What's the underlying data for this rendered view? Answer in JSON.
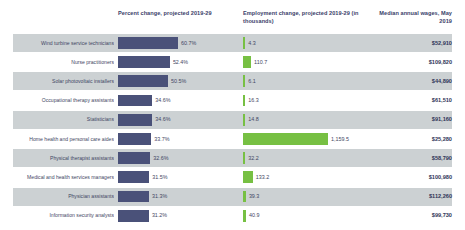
{
  "header": {
    "percent_change": "Percent change, projected 2019-29",
    "employment_change": "Employment change, projected 2019-29 (in thousands)",
    "median_wages": "Median annual wages, May 2019"
  },
  "colors": {
    "percent_bar": "#4a5179",
    "employment_bar": "#77c043",
    "stripe": "#ccd1d3",
    "text": "#3f4663",
    "header_text": "#3a4169"
  },
  "chart_data": {
    "type": "bar",
    "title": "",
    "xlabel": "",
    "ylabel": "",
    "categories": [
      "Wind turbine service technicians",
      "Nurse practitioners",
      "Solar photovoltaic installers",
      "Occupational therapy assistants",
      "Statisticians",
      "Home health and personal care aides",
      "Physical therapist assistants",
      "Medical and health services managers",
      "Physician assistants",
      "Information security analysts"
    ],
    "series": [
      {
        "name": "Percent change, projected 2019-29",
        "unit": "%",
        "values": [
          60.7,
          52.4,
          50.5,
          34.6,
          34.6,
          33.7,
          32.6,
          31.5,
          31.3,
          31.2
        ],
        "labels": [
          "60.7%",
          "52.4%",
          "50.5%",
          "34.6%",
          "34.6%",
          "33.7%",
          "32.6%",
          "31.5%",
          "31.3%",
          "31.2%"
        ]
      },
      {
        "name": "Employment change, projected 2019-29 (in thousands)",
        "unit": "thousands",
        "values": [
          4.3,
          110.7,
          6.1,
          16.3,
          14.8,
          1159.5,
          32.2,
          133.2,
          39.3,
          40.9
        ],
        "labels": [
          "4.3",
          "110.7",
          "6.1",
          "16.3",
          "14.8",
          "1,159.5",
          "32.2",
          "133.2",
          "39.3",
          "40.9"
        ]
      },
      {
        "name": "Median annual wages, May 2019",
        "unit": "USD",
        "values": [
          52910,
          109820,
          44890,
          61510,
          91160,
          25280,
          58790,
          100980,
          112260,
          99730
        ],
        "labels": [
          "$52,910",
          "$109,820",
          "$44,890",
          "$61,510",
          "$91,160",
          "$25,280",
          "$58,790",
          "$100,980",
          "$112,260",
          "$99,730"
        ]
      }
    ]
  },
  "rows": [
    {
      "occupation": "Wind turbine service technicians",
      "percent": 60.7,
      "percent_label": "60.7%",
      "employment": 4.3,
      "employment_label": "4.3",
      "wage_label": "$52,910"
    },
    {
      "occupation": "Nurse practitioners",
      "percent": 52.4,
      "percent_label": "52.4%",
      "employment": 110.7,
      "employment_label": "110.7",
      "wage_label": "$109,820"
    },
    {
      "occupation": "Solar photovoltaic installers",
      "percent": 50.5,
      "percent_label": "50.5%",
      "employment": 6.1,
      "employment_label": "6.1",
      "wage_label": "$44,890"
    },
    {
      "occupation": "Occupational therapy assistants",
      "percent": 34.6,
      "percent_label": "34.6%",
      "employment": 16.3,
      "employment_label": "16.3",
      "wage_label": "$61,510"
    },
    {
      "occupation": "Statisticians",
      "percent": 34.6,
      "percent_label": "34.6%",
      "employment": 14.8,
      "employment_label": "14.8",
      "wage_label": "$91,160"
    },
    {
      "occupation": "Home health and personal care aides",
      "percent": 33.7,
      "percent_label": "33.7%",
      "employment": 1159.5,
      "employment_label": "1,159.5",
      "wage_label": "$25,280"
    },
    {
      "occupation": "Physical therapist assistants",
      "percent": 32.6,
      "percent_label": "32.6%",
      "employment": 32.2,
      "employment_label": "32.2",
      "wage_label": "$58,790"
    },
    {
      "occupation": "Medical and health services managers",
      "percent": 31.5,
      "percent_label": "31.5%",
      "employment": 133.2,
      "employment_label": "133.2",
      "wage_label": "$100,980"
    },
    {
      "occupation": "Physician assistants",
      "percent": 31.3,
      "percent_label": "31.3%",
      "employment": 39.3,
      "employment_label": "39.3",
      "wage_label": "$112,260"
    },
    {
      "occupation": "Information security analysts",
      "percent": 31.2,
      "percent_label": "31.2%",
      "employment": 40.9,
      "employment_label": "40.9",
      "wage_label": "$99,730"
    }
  ],
  "scale": {
    "percent_bar_px_per_unit": 0.99,
    "employment_bar_px_per_unit": 0.0733,
    "employment_bar_min_px": 2.2,
    "row_height_px": 19.2,
    "first_row_top_px": 33.5
  }
}
